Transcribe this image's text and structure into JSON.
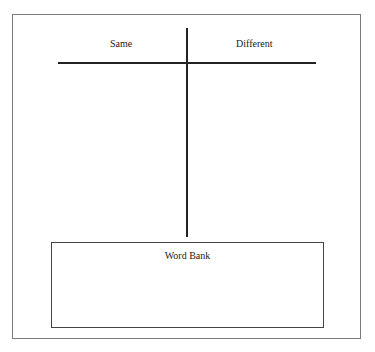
{
  "chart": {
    "columns": [
      {
        "label": "Same"
      },
      {
        "label": "Different"
      }
    ]
  },
  "word_bank": {
    "title": "Word Bank",
    "words": []
  }
}
